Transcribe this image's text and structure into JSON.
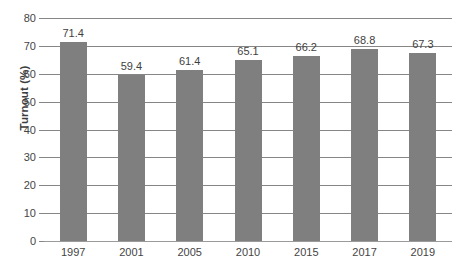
{
  "chart_data": {
    "type": "bar",
    "title": "",
    "subtitle": "",
    "xlabel": "",
    "ylabel": "Turnout (%)",
    "categories": [
      "1997",
      "2001",
      "2005",
      "2010",
      "2015",
      "2017",
      "2019"
    ],
    "values": [
      71.4,
      59.4,
      61.4,
      65.1,
      66.2,
      68.8,
      67.3
    ],
    "value_labels": [
      "71.4",
      "59.4",
      "61.4",
      "65.1",
      "66.2",
      "68.8",
      "67.3"
    ],
    "ylim": [
      0,
      80
    ],
    "ytick_labels": [
      "80",
      "70",
      "60",
      "50",
      "40",
      "30",
      "20",
      "10",
      "0"
    ],
    "ytick_values": [
      80,
      70,
      60,
      50,
      40,
      30,
      20,
      10,
      0
    ],
    "ytick_step": 10,
    "grid": "horizontal",
    "legend": "none",
    "series_name": "Turnout",
    "bar_color": "#7f7f7f",
    "gridline_color": "#868686",
    "text_color": "#3f3f3f",
    "background": "#ffffff"
  },
  "figure": {
    "caption": ""
  }
}
